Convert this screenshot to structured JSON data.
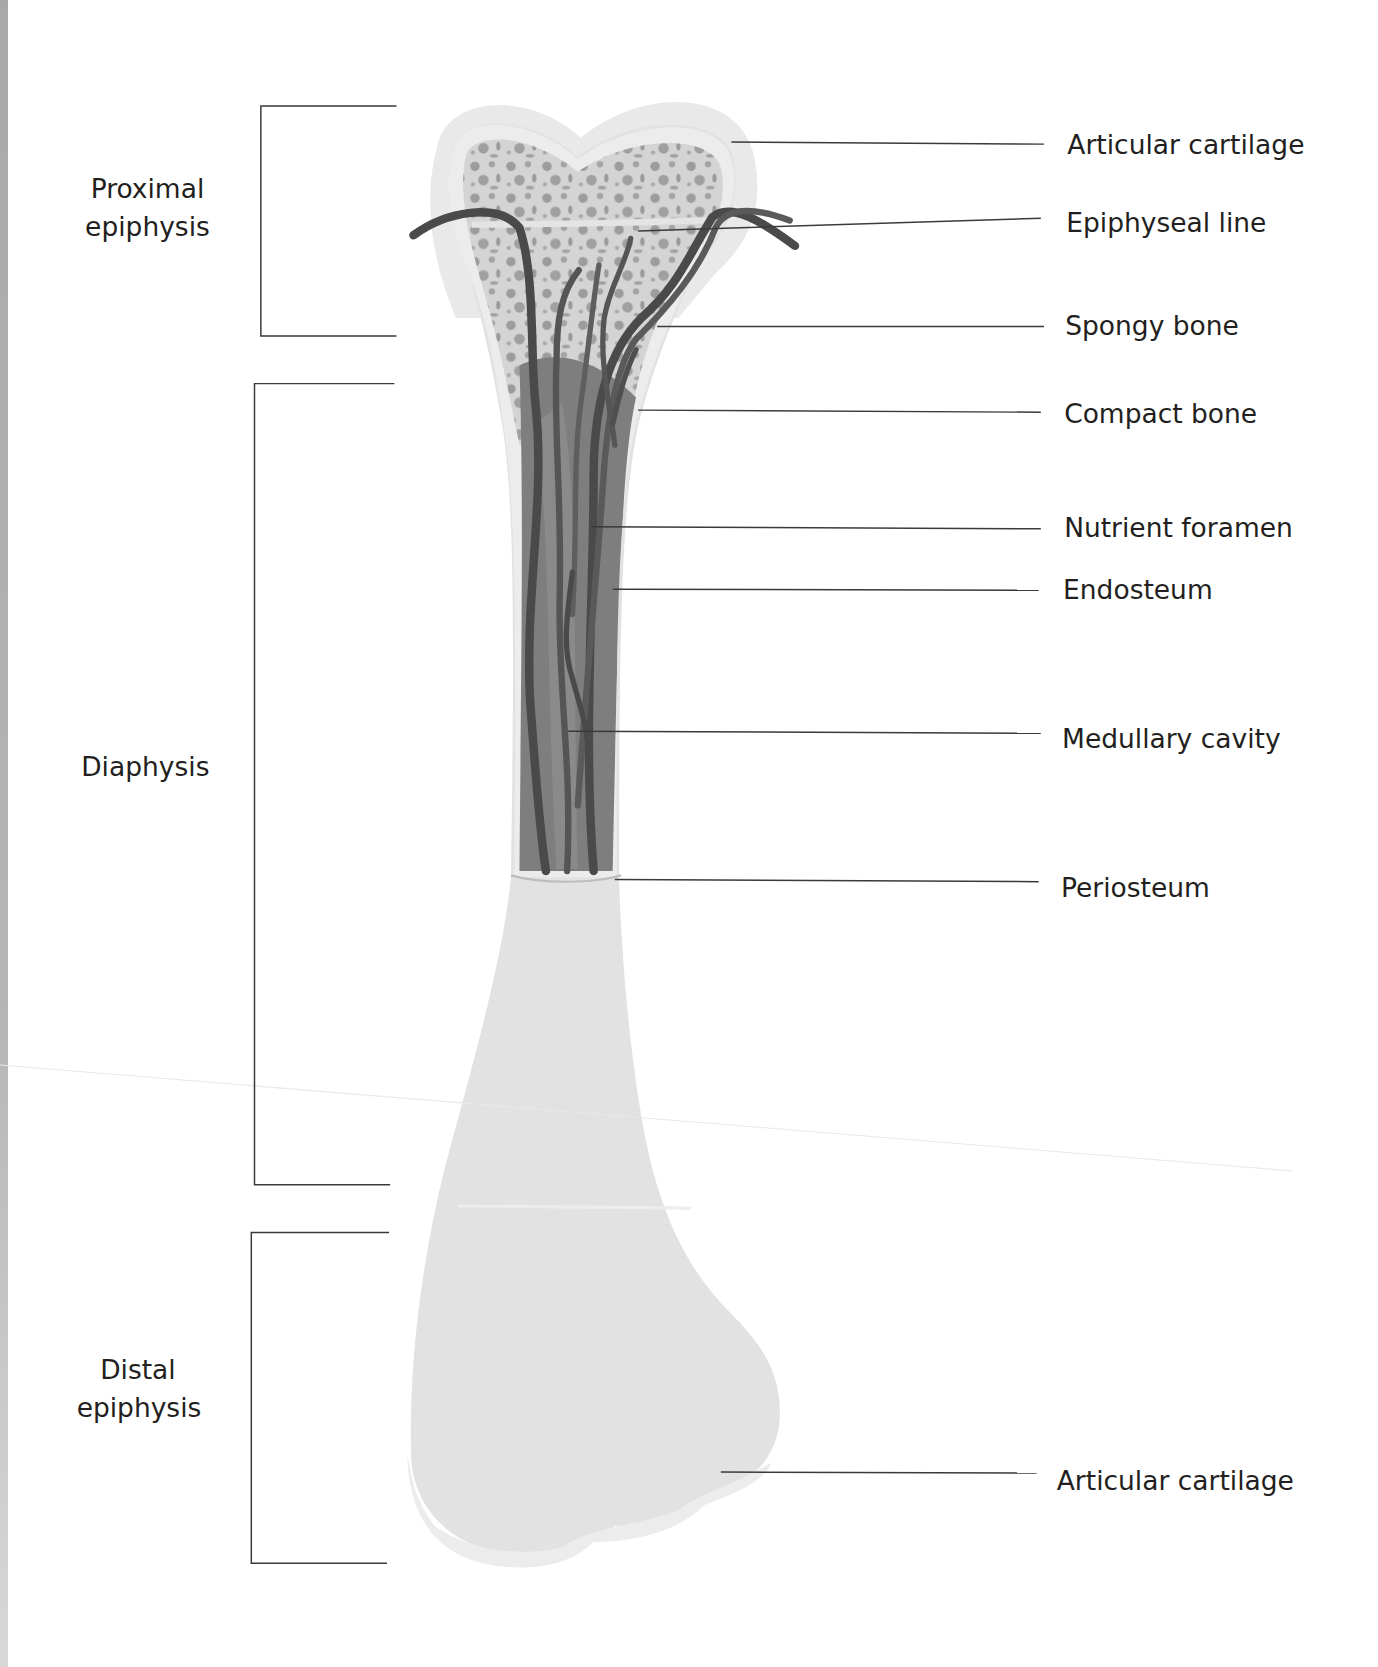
{
  "diagram": {
    "colors": {
      "cartilage": "#e6e6e6",
      "bone_surface": "#e3e3e3",
      "spongy_bg": "#d6d6d6",
      "spongy_holes": "#9a9a9a",
      "marrow": "#7d7d7d",
      "vessels": "#4a4a4a",
      "compact": "#ececec",
      "text": "#231f20",
      "leader": "#3a3a3a"
    },
    "regions": [
      {
        "label_line1": "Proximal",
        "label_line2": "epiphysis"
      },
      {
        "label_line1": "Diaphysis",
        "label_line2": ""
      },
      {
        "label_line1": "Distal",
        "label_line2": "epiphysis"
      }
    ],
    "labels": [
      {
        "text": "Articular cartilage"
      },
      {
        "text": "Epiphyseal line"
      },
      {
        "text": "Spongy bone"
      },
      {
        "text": "Compact bone"
      },
      {
        "text": "Nutrient foramen"
      },
      {
        "text": "Endosteum"
      },
      {
        "text": "Medullary cavity"
      },
      {
        "text": "Periosteum"
      },
      {
        "text": "Articular cartilage"
      }
    ]
  }
}
